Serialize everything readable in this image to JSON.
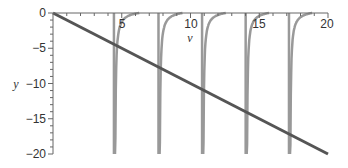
{
  "chart_data": {
    "type": "line",
    "title": "",
    "xlabel": "v",
    "ylabel": "y",
    "xlim": [
      0,
      20
    ],
    "ylim": [
      -20,
      0
    ],
    "xticks": [
      5,
      10,
      15,
      20
    ],
    "yticks": [
      0,
      -5,
      -10,
      -15,
      -20
    ],
    "grid": false,
    "legend": null,
    "series": [
      {
        "name": "line y = -v",
        "color": "#555555",
        "points": [
          [
            0,
            0
          ],
          [
            20,
            -20
          ]
        ]
      },
      {
        "name": "curve branches (asymptotes)",
        "color": "#999999",
        "asymptotes": [
          4.49,
          7.73,
          10.9,
          14.07,
          17.22
        ],
        "branch_zero_crossings": [
          6.28,
          9.42,
          12.57,
          15.71,
          18.85
        ]
      }
    ],
    "intersections": [
      {
        "v": 1.7,
        "y": -1.7
      },
      {
        "v": 4.6,
        "y": -4.6
      },
      {
        "v": 7.8,
        "y": -7.8
      },
      {
        "v": 11.0,
        "y": -11.0
      },
      {
        "v": 14.1,
        "y": -14.1
      },
      {
        "v": 17.3,
        "y": -17.3
      }
    ]
  },
  "labels": {
    "x_axis": "v",
    "y_axis": "y",
    "x_ticks": [
      "5",
      "10",
      "15",
      "20"
    ],
    "y_ticks": [
      "0",
      "−5",
      "−10",
      "−15",
      "−20"
    ]
  }
}
